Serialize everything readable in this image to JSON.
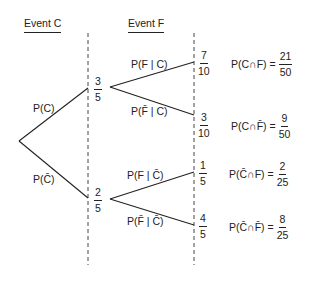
{
  "headers": {
    "event_c": "Event C",
    "event_f": "Event F"
  },
  "first_stage": {
    "upper_branch_label": "P(C)",
    "lower_branch_label": "P(C̄)",
    "upper_node_value": {
      "num": "3",
      "den": "5"
    },
    "lower_node_value": {
      "num": "2",
      "den": "5"
    }
  },
  "second_stage": {
    "branches": [
      {
        "label": "P(F | C)",
        "value": {
          "num": "7",
          "den": "10"
        }
      },
      {
        "label": "P(F̄ | C)",
        "value": {
          "num": "3",
          "den": "10"
        }
      },
      {
        "label": "P(F | C̄)",
        "value": {
          "num": "1",
          "den": "5"
        }
      },
      {
        "label": "P(F̄ | C̄)",
        "value": {
          "num": "4",
          "den": "5"
        }
      }
    ]
  },
  "joint_probabilities": [
    {
      "label": "P(C∩F)",
      "eq": "=",
      "num": "21",
      "den": "50"
    },
    {
      "label": "P(C∩F̄)",
      "eq": "=",
      "num": "9",
      "den": "50"
    },
    {
      "label": "P(C̄∩F)",
      "eq": "=",
      "num": "2",
      "den": "25"
    },
    {
      "label": "P(C̄∩F̄)",
      "eq": "=",
      "num": "8",
      "den": "25"
    }
  ],
  "colors": {
    "line": "#222222",
    "background": "#ffffff"
  }
}
